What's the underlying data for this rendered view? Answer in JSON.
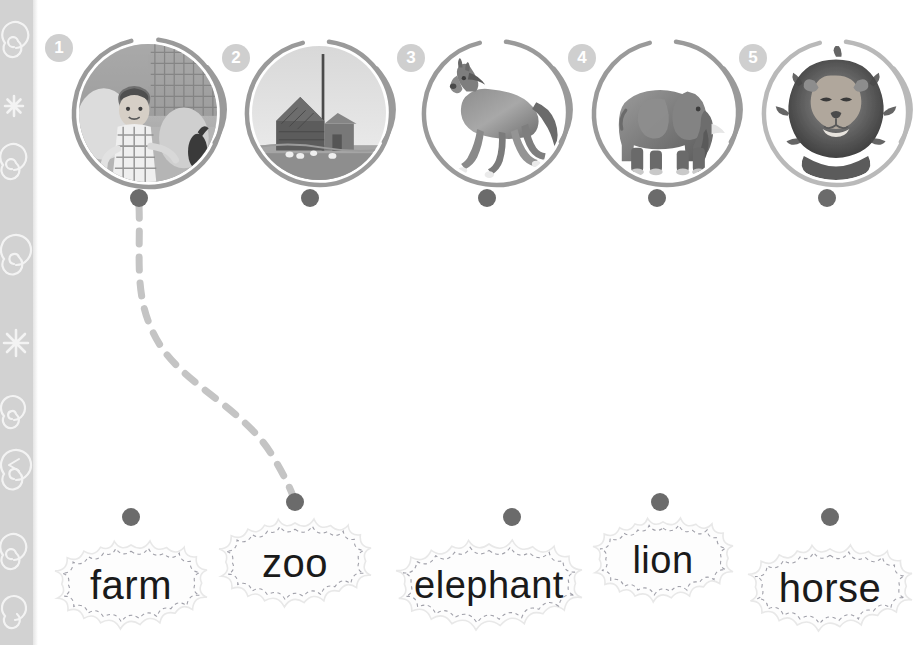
{
  "page": {
    "width": 915,
    "height": 645,
    "background_color": "#ffffff"
  },
  "sidebar": {
    "name": "decorative-strip",
    "color": "#d2d2d2",
    "doodle_color": "#ffffff",
    "doodles": [
      "spiral",
      "asterisk",
      "spiral",
      "spiral",
      "asterisk",
      "spiral",
      "spiral",
      "spiral"
    ]
  },
  "colors": {
    "dot": "#6b6b6b",
    "ring": "#9a9a9a",
    "ring_light": "#b9b9b9",
    "badge_fill": "#cfcfcf",
    "badge_text": "#ffffff",
    "link_line": "#c4c4c4",
    "cloud_fill": "#fdfdfd",
    "cloud_stitch": "#8f8f9a",
    "cloud_outline": "#e8e8e8",
    "word_text": "#1a1a1a"
  },
  "pictures": [
    {
      "number": "1",
      "name": "picture-boy-on-farm",
      "alt": "boy on a farm",
      "cx": 139,
      "cy": 104,
      "r": 73,
      "badge_x": 45,
      "badge_y": 34,
      "ring_style": "solid-tail"
    },
    {
      "number": "2",
      "name": "picture-barn",
      "alt": "barn and farmhouse",
      "cx": 310,
      "cy": 104,
      "r": 71,
      "badge_x": 222,
      "badge_y": 44,
      "ring_style": "solid-tail"
    },
    {
      "number": "3",
      "name": "picture-horse",
      "alt": "galloping horse",
      "cx": 487,
      "cy": 104,
      "r": 71,
      "badge_x": 397,
      "badge_y": 44,
      "ring_style": "solid-tail"
    },
    {
      "number": "4",
      "name": "picture-elephant",
      "alt": "african elephant",
      "cx": 657,
      "cy": 104,
      "r": 71,
      "badge_x": 568,
      "badge_y": 44,
      "ring_style": "solid-tail"
    },
    {
      "number": "5",
      "name": "picture-lion",
      "alt": "lion head",
      "cx": 827,
      "cy": 104,
      "r": 71,
      "badge_x": 739,
      "badge_y": 44,
      "ring_style": "light-tail"
    }
  ],
  "picture_dots": [
    {
      "name": "picture-dot-1",
      "x": 139,
      "y": 198
    },
    {
      "name": "picture-dot-2",
      "x": 310,
      "y": 198
    },
    {
      "name": "picture-dot-3",
      "x": 487,
      "y": 198
    },
    {
      "name": "picture-dot-4",
      "x": 657,
      "y": 198
    },
    {
      "name": "picture-dot-5",
      "x": 827,
      "y": 198
    }
  ],
  "words": [
    {
      "label": "farm",
      "name": "word-cloud-farm",
      "cx": 131,
      "cy": 585,
      "w": 152,
      "h": 88,
      "font_size": 40,
      "dot_x": 131,
      "dot_y": 517
    },
    {
      "label": "zoo",
      "name": "word-cloud-zoo",
      "cx": 295,
      "cy": 563,
      "w": 152,
      "h": 88,
      "font_size": 40,
      "dot_x": 295,
      "dot_y": 502
    },
    {
      "label": "elephant",
      "name": "word-cloud-elephant",
      "cx": 489,
      "cy": 585,
      "w": 186,
      "h": 90,
      "font_size": 38,
      "dot_x": 512,
      "dot_y": 517
    },
    {
      "label": "lion",
      "name": "word-cloud-lion",
      "cx": 663,
      "cy": 560,
      "w": 140,
      "h": 84,
      "font_size": 38,
      "dot_x": 660,
      "dot_y": 502
    },
    {
      "label": "horse",
      "name": "word-cloud-horse",
      "cx": 830,
      "cy": 588,
      "w": 164,
      "h": 86,
      "font_size": 40,
      "dot_x": 830,
      "dot_y": 517
    }
  ],
  "links": [
    {
      "name": "link-picture-1-to-zoo",
      "from": "picture-dot-1",
      "to": "word-dot-zoo",
      "path": "M 139 205 C 141 260 132 300 160 345 C 185 385 245 410 272 455 C 284 475 290 488 293 496",
      "style": "dashed",
      "color": "#c4c4c4",
      "width": 7
    }
  ]
}
